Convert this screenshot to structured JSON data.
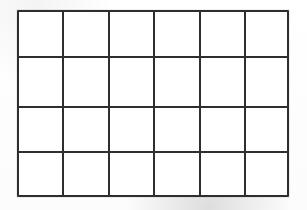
{
  "document": {
    "title": "Blank grid worksheet",
    "description": "Empty rectangular grid table",
    "background_color": "#ffffff",
    "line_color": "#2e2e2e",
    "cell_color": "#ffffff"
  },
  "grid": {
    "columns": 6,
    "rows": 4,
    "total_cells": 24,
    "line_width_px": 2,
    "bounds": {
      "left": 17,
      "top": 10,
      "width": 272,
      "height": 187
    },
    "column_edges_px": [
      18,
      63,
      109,
      154,
      200,
      245,
      288
    ],
    "row_edges_px": [
      11,
      57,
      107,
      152,
      196
    ],
    "cells": [
      [
        "",
        "",
        "",
        "",
        "",
        ""
      ],
      [
        "",
        "",
        "",
        "",
        "",
        ""
      ],
      [
        "",
        "",
        "",
        "",
        "",
        ""
      ],
      [
        "",
        "",
        "",
        "",
        "",
        ""
      ]
    ]
  }
}
